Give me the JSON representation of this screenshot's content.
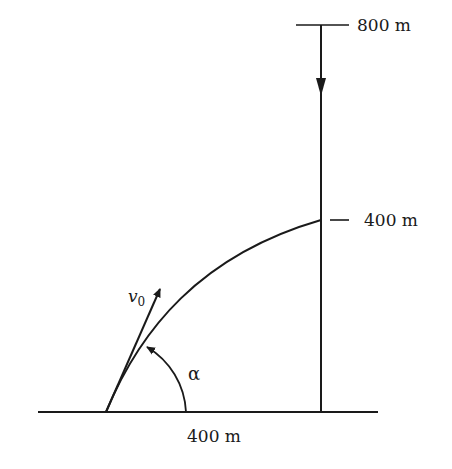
{
  "figure": {
    "colors": {
      "ink": "#1a1a1a",
      "background": "#ffffff"
    }
  },
  "labels": {
    "top_height": "800 m",
    "hit_height": "400 m",
    "horizontal_distance": "400 m",
    "velocity_symbol": "v",
    "velocity_subscript": "0",
    "angle_symbol": "α"
  },
  "geometry": {
    "ground": {
      "x1": 38,
      "x2": 378,
      "y": 412
    },
    "launch_point": {
      "x": 106,
      "y": 412
    },
    "vertical_line": {
      "x": 321,
      "y_top": 25,
      "y_bottom": 412
    },
    "top_tick": {
      "x1": 296,
      "x2": 349,
      "y": 25
    },
    "hit_tick": {
      "x1": 330,
      "x2": 349,
      "y": 220
    },
    "trajectory_end": {
      "x": 321,
      "y": 220
    },
    "velocity_arrow_tip": {
      "x": 161,
      "y": 286
    },
    "angle_arc_radius": 80
  }
}
